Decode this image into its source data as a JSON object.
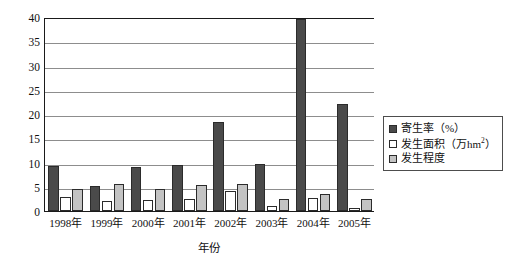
{
  "chart_data": {
    "type": "bar",
    "title": "",
    "xlabel": "年份",
    "ylabel": "",
    "categories": [
      "1998年",
      "1999年",
      "2000年",
      "2001年",
      "2002年",
      "2003年",
      "2004年",
      "2005年"
    ],
    "series": [
      {
        "name": "寄生率（%）",
        "values": [
          9.2,
          5.2,
          9.1,
          9.4,
          18.3,
          9.6,
          39.5,
          22.1
        ]
      },
      {
        "name": "发生面积（万hm²）",
        "values": [
          2.8,
          2.0,
          2.2,
          2.5,
          4.1,
          1.0,
          2.7,
          0.6
        ]
      },
      {
        "name": "发生程度",
        "values": [
          4.6,
          5.5,
          4.6,
          5.3,
          5.5,
          2.5,
          3.5,
          2.5
        ]
      }
    ],
    "ylim": [
      0,
      40
    ],
    "yticks": [
      0,
      5,
      10,
      15,
      20,
      25,
      30,
      35,
      40
    ],
    "grid": true,
    "legend_position": "right"
  },
  "legend": {
    "items": [
      {
        "label_main": "寄生率（%）",
        "sup": "",
        "label_tail": ""
      },
      {
        "label_main": "发生面积（万hm",
        "sup": "2",
        "label_tail": "）"
      },
      {
        "label_main": "发生程度",
        "sup": "",
        "label_tail": ""
      }
    ]
  },
  "colors": {
    "series_0": "#4a4a4a",
    "series_1": "#ffffff",
    "series_2": "#c3c3c3",
    "axis": "#1a1a1a",
    "grid": "#8d8d8d",
    "text": "#111111",
    "background": "#ffffff"
  }
}
